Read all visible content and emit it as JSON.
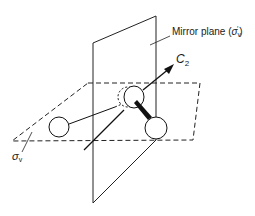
{
  "diagram": {
    "labels": {
      "mirror_plane": "Mirror plane (",
      "mirror_sigma": "σ",
      "mirror_sub": "v",
      "mirror_prime": "′",
      "mirror_close": ")",
      "axis": "C",
      "axis_sub": "2",
      "horizontal_sigma": "σ",
      "horizontal_sub": "v"
    },
    "elements": {
      "vertical_plane": "mirror plane σv′",
      "horizontal_plane": "plane σv",
      "atoms": [
        "left atom",
        "central atom",
        "right atom"
      ],
      "axis_arrow": "C2 rotation axis"
    }
  }
}
